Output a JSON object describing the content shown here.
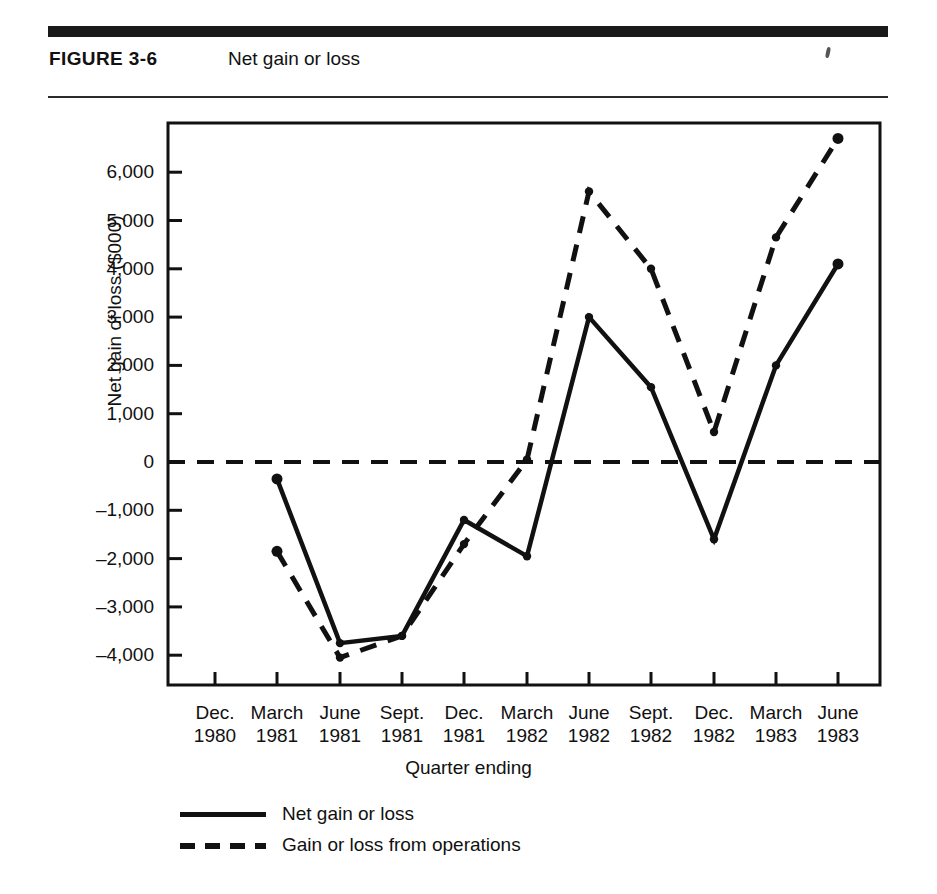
{
  "figure": {
    "number_label": "FIGURE 3-6",
    "title": "Net gain or loss"
  },
  "chart_data": {
    "type": "line",
    "title": "Net gain or loss",
    "xlabel": "Quarter ending",
    "ylabel": "Net gain of loss ($000)",
    "ylim": [
      -4600,
      7000
    ],
    "yticks": [
      6000,
      5000,
      4000,
      3000,
      2000,
      1000,
      0,
      -1000,
      -2000,
      -3000,
      -4000
    ],
    "ytick_labels": [
      "6,000",
      "5,000",
      "4,000",
      "3,000",
      "2,000",
      "1,000",
      "0",
      "–1,000",
      "–2,000",
      "–3,000",
      "–4,000"
    ],
    "grid": false,
    "zero_line": true,
    "legend_position": "below-left",
    "categories": [
      "Dec. 1980",
      "March 1981",
      "June 1981",
      "Sept. 1981",
      "Dec. 1981",
      "March 1982",
      "June 1982",
      "Sept. 1982",
      "Dec. 1982",
      "March 1983",
      "June 1983"
    ],
    "xtick_labels": [
      {
        "month": "Dec.",
        "year": "1980"
      },
      {
        "month": "March",
        "year": "1981"
      },
      {
        "month": "June",
        "year": "1981"
      },
      {
        "month": "Sept.",
        "year": "1981"
      },
      {
        "month": "Dec.",
        "year": "1981"
      },
      {
        "month": "March",
        "year": "1982"
      },
      {
        "month": "June",
        "year": "1982"
      },
      {
        "month": "Sept.",
        "year": "1982"
      },
      {
        "month": "Dec.",
        "year": "1982"
      },
      {
        "month": "March",
        "year": "1983"
      },
      {
        "month": "June",
        "year": "1983"
      }
    ],
    "series": [
      {
        "name": "Net gain or loss",
        "style": "solid",
        "values": [
          null,
          -350,
          -3750,
          -3600,
          -1200,
          -1950,
          3000,
          1550,
          -1600,
          2000,
          4100
        ]
      },
      {
        "name": "Gain or loss from operations",
        "style": "dashed",
        "values": [
          null,
          -1850,
          -4050,
          -3600,
          -1700,
          50,
          5600,
          4000,
          620,
          4650,
          6700
        ]
      }
    ]
  },
  "legend": {
    "items": [
      {
        "label": "Net gain or loss",
        "style": "solid"
      },
      {
        "label": "Gain or loss from operations",
        "style": "dashed"
      }
    ]
  }
}
